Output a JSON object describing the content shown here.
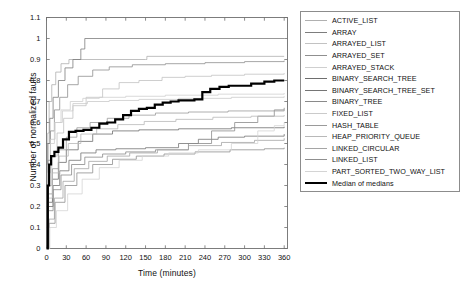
{
  "chart_data": {
    "type": "line",
    "title": "",
    "xlabel": "Time (minutes)",
    "ylabel": "Number of normalized faults",
    "xlim": [
      0,
      365
    ],
    "ylim": [
      0,
      1.1
    ],
    "xticks": [
      0,
      30,
      60,
      90,
      120,
      150,
      180,
      210,
      240,
      270,
      300,
      330,
      360
    ],
    "yticks": [
      0,
      0.1,
      0.2,
      0.3,
      0.4,
      0.5,
      0.6,
      0.7,
      0.8,
      0.9,
      1,
      1.1
    ],
    "grid": false,
    "legend_position": "right-outside",
    "frame": "box",
    "series": [
      {
        "name": "ACTIVE_LIST",
        "color": "#b0b0b0",
        "width": 0.8,
        "points": [
          [
            0,
            0
          ],
          [
            2,
            0.55
          ],
          [
            4,
            0.7
          ],
          [
            8,
            0.78
          ],
          [
            14,
            0.84
          ],
          [
            22,
            0.88
          ],
          [
            34,
            0.9
          ],
          [
            150,
            0.9
          ],
          [
            152,
            0.915
          ],
          [
            360,
            0.915
          ]
        ]
      },
      {
        "name": "ARRAY",
        "color": "#7d7d7d",
        "width": 0.8,
        "points": [
          [
            0,
            0
          ],
          [
            2,
            0.5
          ],
          [
            5,
            0.62
          ],
          [
            10,
            0.72
          ],
          [
            18,
            0.8
          ],
          [
            28,
            0.86
          ],
          [
            40,
            0.9
          ],
          [
            52,
            0.95
          ],
          [
            58,
            1.0
          ],
          [
            360,
            1.0
          ]
        ]
      },
      {
        "name": "ARRAYED_LIST",
        "color": "#c2c2c2",
        "width": 0.8,
        "points": [
          [
            0,
            0
          ],
          [
            3,
            0.3
          ],
          [
            8,
            0.44
          ],
          [
            16,
            0.55
          ],
          [
            26,
            0.62
          ],
          [
            40,
            0.68
          ],
          [
            60,
            0.72
          ],
          [
            85,
            0.76
          ],
          [
            110,
            0.79
          ],
          [
            140,
            0.8
          ],
          [
            175,
            0.815
          ],
          [
            210,
            0.82
          ],
          [
            250,
            0.825
          ],
          [
            300,
            0.83
          ],
          [
            360,
            0.835
          ]
        ]
      },
      {
        "name": "ARRAYED_SET",
        "color": "#8f8f8f",
        "width": 0.8,
        "points": [
          [
            0,
            0
          ],
          [
            2,
            0.42
          ],
          [
            6,
            0.56
          ],
          [
            12,
            0.66
          ],
          [
            20,
            0.72
          ],
          [
            32,
            0.78
          ],
          [
            48,
            0.82
          ],
          [
            70,
            0.85
          ],
          [
            95,
            0.865
          ],
          [
            130,
            0.875
          ],
          [
            180,
            0.88
          ],
          [
            240,
            0.885
          ],
          [
            300,
            0.89
          ],
          [
            360,
            0.895
          ]
        ]
      },
      {
        "name": "ARRAYED_STACK",
        "color": "#cfcfcf",
        "width": 0.8,
        "points": [
          [
            0,
            0
          ],
          [
            2,
            0.36
          ],
          [
            6,
            0.5
          ],
          [
            12,
            0.6
          ],
          [
            22,
            0.66
          ],
          [
            36,
            0.7
          ],
          [
            55,
            0.715
          ],
          [
            80,
            0.72
          ],
          [
            120,
            0.725
          ],
          [
            180,
            0.73
          ],
          [
            260,
            0.735
          ],
          [
            360,
            0.74
          ]
        ]
      },
      {
        "name": "BINARY_SEARCH_TREE",
        "color": "#6e6e6e",
        "width": 0.8,
        "points": [
          [
            0,
            0
          ],
          [
            3,
            0.22
          ],
          [
            9,
            0.33
          ],
          [
            18,
            0.41
          ],
          [
            30,
            0.47
          ],
          [
            48,
            0.51
          ],
          [
            70,
            0.545
          ],
          [
            100,
            0.56
          ],
          [
            140,
            0.565
          ],
          [
            200,
            0.57
          ],
          [
            280,
            0.575
          ],
          [
            360,
            0.58
          ]
        ]
      },
      {
        "name": "BINARY_SEARCH_TREE_SET",
        "color": "#757575",
        "width": 0.8,
        "points": [
          [
            0,
            0
          ],
          [
            3,
            0.2
          ],
          [
            10,
            0.3
          ],
          [
            20,
            0.37
          ],
          [
            34,
            0.42
          ],
          [
            52,
            0.455
          ],
          [
            75,
            0.47
          ],
          [
            105,
            0.475
          ],
          [
            150,
            0.48
          ],
          [
            200,
            0.5
          ],
          [
            230,
            0.52
          ],
          [
            260,
            0.53
          ],
          [
            300,
            0.535
          ],
          [
            360,
            0.545
          ]
        ]
      },
      {
        "name": "BINARY_TREE",
        "color": "#8a8a8a",
        "width": 0.8,
        "points": [
          [
            0,
            0
          ],
          [
            3,
            0.18
          ],
          [
            10,
            0.28
          ],
          [
            22,
            0.35
          ],
          [
            38,
            0.4
          ],
          [
            58,
            0.435
          ],
          [
            85,
            0.45
          ],
          [
            120,
            0.46
          ],
          [
            165,
            0.47
          ],
          [
            215,
            0.5
          ],
          [
            250,
            0.56
          ],
          [
            285,
            0.6
          ],
          [
            320,
            0.63
          ],
          [
            345,
            0.66
          ],
          [
            360,
            0.67
          ]
        ]
      },
      {
        "name": "FIXED_LIST",
        "color": "#cacaca",
        "width": 0.8,
        "points": [
          [
            0,
            0
          ],
          [
            2,
            0.4
          ],
          [
            6,
            0.52
          ],
          [
            13,
            0.6
          ],
          [
            24,
            0.655
          ],
          [
            40,
            0.69
          ],
          [
            62,
            0.7
          ],
          [
            95,
            0.705
          ],
          [
            140,
            0.71
          ],
          [
            200,
            0.715
          ],
          [
            280,
            0.72
          ],
          [
            360,
            0.725
          ]
        ]
      },
      {
        "name": "HASH_TABLE",
        "color": "#9a9a9a",
        "width": 0.8,
        "points": [
          [
            0,
            0
          ],
          [
            3,
            0.26
          ],
          [
            9,
            0.38
          ],
          [
            18,
            0.47
          ],
          [
            30,
            0.53
          ],
          [
            46,
            0.575
          ],
          [
            66,
            0.6
          ],
          [
            92,
            0.62
          ],
          [
            125,
            0.635
          ],
          [
            165,
            0.645
          ],
          [
            215,
            0.65
          ],
          [
            275,
            0.655
          ],
          [
            360,
            0.66
          ]
        ]
      },
      {
        "name": "HEAP_PRIORITY_QUEUE",
        "color": "#b8b8b8",
        "width": 0.8,
        "points": [
          [
            0,
            0
          ],
          [
            3,
            0.24
          ],
          [
            9,
            0.36
          ],
          [
            19,
            0.44
          ],
          [
            33,
            0.5
          ],
          [
            52,
            0.545
          ],
          [
            76,
            0.57
          ],
          [
            108,
            0.59
          ],
          [
            148,
            0.605
          ],
          [
            196,
            0.615
          ],
          [
            252,
            0.625
          ],
          [
            310,
            0.63
          ],
          [
            360,
            0.635
          ]
        ]
      },
      {
        "name": "LINKED_CIRCULAR",
        "color": "#a5a5a5",
        "width": 0.8,
        "points": [
          [
            0,
            0
          ],
          [
            4,
            0.14
          ],
          [
            12,
            0.24
          ],
          [
            25,
            0.32
          ],
          [
            42,
            0.38
          ],
          [
            64,
            0.415
          ],
          [
            92,
            0.44
          ],
          [
            126,
            0.455
          ],
          [
            168,
            0.47
          ],
          [
            215,
            0.49
          ],
          [
            265,
            0.505
          ],
          [
            315,
            0.515
          ],
          [
            360,
            0.525
          ]
        ]
      },
      {
        "name": "LINKED_LIST",
        "color": "#8f8f8f",
        "width": 0.8,
        "points": [
          [
            0,
            0
          ],
          [
            4,
            0.12
          ],
          [
            13,
            0.22
          ],
          [
            28,
            0.3
          ],
          [
            46,
            0.36
          ],
          [
            70,
            0.4
          ],
          [
            100,
            0.425
          ],
          [
            136,
            0.44
          ],
          [
            178,
            0.45
          ],
          [
            225,
            0.46
          ],
          [
            278,
            0.47
          ],
          [
            330,
            0.475
          ],
          [
            360,
            0.48
          ]
        ]
      },
      {
        "name": "PART_SORTED_TWO_WAY_LIST",
        "color": "#d4d4d4",
        "width": 0.8,
        "points": [
          [
            0,
            0
          ],
          [
            5,
            0.1
          ],
          [
            15,
            0.18
          ],
          [
            32,
            0.26
          ],
          [
            54,
            0.33
          ],
          [
            80,
            0.385
          ],
          [
            110,
            0.42
          ],
          [
            145,
            0.44
          ],
          [
            185,
            0.455
          ],
          [
            230,
            0.47
          ],
          [
            280,
            0.5
          ],
          [
            320,
            0.56
          ],
          [
            345,
            0.585
          ],
          [
            360,
            0.6
          ]
        ]
      },
      {
        "name": "Median of medians",
        "color": "#000000",
        "width": 2.2,
        "points": [
          [
            0,
            0
          ],
          [
            2,
            0.3
          ],
          [
            4,
            0.4
          ],
          [
            7,
            0.44
          ],
          [
            12,
            0.46
          ],
          [
            18,
            0.48
          ],
          [
            25,
            0.52
          ],
          [
            34,
            0.555
          ],
          [
            44,
            0.56
          ],
          [
            56,
            0.565
          ],
          [
            68,
            0.575
          ],
          [
            80,
            0.595
          ],
          [
            92,
            0.6
          ],
          [
            104,
            0.615
          ],
          [
            116,
            0.635
          ],
          [
            128,
            0.655
          ],
          [
            140,
            0.665
          ],
          [
            152,
            0.67
          ],
          [
            164,
            0.685
          ],
          [
            176,
            0.695
          ],
          [
            188,
            0.7
          ],
          [
            200,
            0.705
          ],
          [
            212,
            0.705
          ],
          [
            224,
            0.71
          ],
          [
            236,
            0.745
          ],
          [
            248,
            0.76
          ],
          [
            262,
            0.77
          ],
          [
            276,
            0.775
          ],
          [
            296,
            0.775
          ],
          [
            310,
            0.785
          ],
          [
            330,
            0.795
          ],
          [
            345,
            0.8
          ],
          [
            360,
            0.8
          ]
        ]
      }
    ]
  },
  "legend": {
    "items": [
      {
        "label": "ACTIVE_LIST",
        "color": "#b0b0b0",
        "width": 0.8
      },
      {
        "label": "ARRAY",
        "color": "#7d7d7d",
        "width": 0.8
      },
      {
        "label": "ARRAYED_LIST",
        "color": "#c2c2c2",
        "width": 0.8
      },
      {
        "label": "ARRAYED_SET",
        "color": "#8f8f8f",
        "width": 0.8
      },
      {
        "label": "ARRAYED_STACK",
        "color": "#cfcfcf",
        "width": 0.8
      },
      {
        "label": "BINARY_SEARCH_TREE",
        "color": "#6e6e6e",
        "width": 0.8
      },
      {
        "label": "BINARY_SEARCH_TREE_SET",
        "color": "#757575",
        "width": 0.8
      },
      {
        "label": "BINARY_TREE",
        "color": "#8a8a8a",
        "width": 0.8
      },
      {
        "label": "FIXED_LIST",
        "color": "#cacaca",
        "width": 0.8
      },
      {
        "label": "HASH_TABLE",
        "color": "#9a9a9a",
        "width": 0.8
      },
      {
        "label": "HEAP_PRIORITY_QUEUE",
        "color": "#b8b8b8",
        "width": 0.8
      },
      {
        "label": "LINKED_CIRCULAR",
        "color": "#a5a5a5",
        "width": 0.8
      },
      {
        "label": "LINKED_LIST",
        "color": "#8f8f8f",
        "width": 0.8
      },
      {
        "label": "PART_SORTED_TWO_WAY_LIST",
        "color": "#d4d4d4",
        "width": 0.8
      },
      {
        "label": "Median of medians",
        "color": "#000000",
        "width": 2.2
      }
    ]
  },
  "axes": {
    "frame_color": "#6f6f6f",
    "tick_color": "#6f6f6f"
  }
}
